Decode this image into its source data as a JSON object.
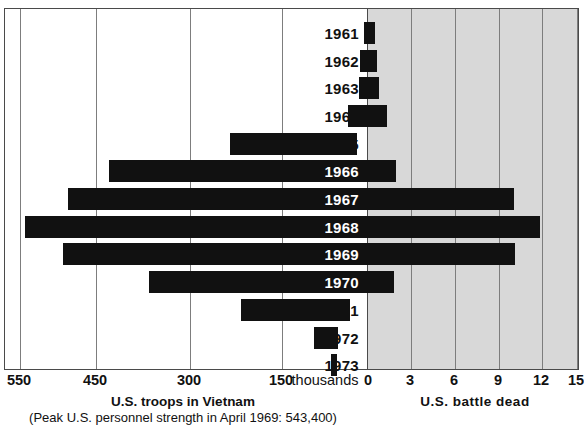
{
  "chart_data": {
    "type": "bar",
    "title": "",
    "subtype": "bidirectional-bar",
    "categories": [
      "1961",
      "1962",
      "1963",
      "1964",
      "1965",
      "1966",
      "1967",
      "1968",
      "1969",
      "1970",
      "1971",
      "1972",
      "1973"
    ],
    "left_axis": {
      "label": "U.S. troops in Vietnam",
      "sublabel": "(Peak U.S. personnel strength in April 1969: 543,400)",
      "unit_label": "thousands",
      "ticks": [
        "550",
        "450",
        "300",
        "150"
      ],
      "tick_values": [
        550,
        450,
        300,
        150
      ],
      "tick_px": [
        19,
        95,
        189,
        281
      ],
      "zero_px": 366,
      "grid": true
    },
    "right_axis": {
      "label": "U.S. battle dead",
      "ticks": [
        "0",
        "3",
        "6",
        "9",
        "12",
        "15"
      ],
      "tick_values": [
        0,
        3,
        6,
        9,
        12,
        15
      ],
      "tick_px": [
        368,
        410,
        454,
        498,
        541,
        576
      ],
      "grid": true,
      "shaded": true,
      "shade_color": "#d8d8d8"
    },
    "series": [
      {
        "name": "U.S. troops in Vietnam",
        "side": "left",
        "values": [
          3.2,
          11.3,
          16.3,
          23.3,
          184.3,
          385.3,
          485.6,
          536.1,
          475.2,
          334.6,
          156.8,
          24.2,
          0.0
        ],
        "px_left": [
          363,
          359,
          358,
          347,
          229,
          108,
          67,
          24,
          62,
          148,
          240,
          313,
          330
        ]
      },
      {
        "name": "U.S. battle dead",
        "side": "right",
        "values": [
          0.1,
          0.3,
          0.5,
          0.6,
          1.4,
          5.0,
          9.4,
          11.6,
          9.4,
          4.2,
          1.4,
          0.3,
          0.2
        ],
        "px_right": [
          374,
          376,
          378,
          386,
          356,
          395,
          513,
          539,
          514,
          393,
          349,
          337,
          336
        ]
      }
    ],
    "bar_color": "#111111",
    "rows_px": [
      {
        "year": "1961",
        "top": 10,
        "height": 27.7,
        "left": 363,
        "right": 374
      },
      {
        "year": "1962",
        "top": 37.7,
        "height": 27.7,
        "left": 359,
        "right": 376
      },
      {
        "year": "1963",
        "top": 65.4,
        "height": 27.7,
        "left": 358,
        "right": 378
      },
      {
        "year": "1964",
        "top": 93.1,
        "height": 27.7,
        "left": 347,
        "right": 386
      },
      {
        "year": "1965",
        "top": 120.8,
        "height": 27.7,
        "left": 229,
        "right": 356
      },
      {
        "year": "1966",
        "top": 148.5,
        "height": 27.7,
        "left": 108,
        "right": 395
      },
      {
        "year": "1967",
        "top": 176.2,
        "height": 27.7,
        "left": 67,
        "right": 513
      },
      {
        "year": "1968",
        "top": 203.9,
        "height": 27.7,
        "left": 24,
        "right": 539
      },
      {
        "year": "1969",
        "top": 231.6,
        "height": 27.7,
        "left": 62,
        "right": 514
      },
      {
        "year": "1970",
        "top": 259.3,
        "height": 27.7,
        "left": 148,
        "right": 393
      },
      {
        "year": "1971",
        "top": 287.0,
        "height": 27.7,
        "left": 240,
        "right": 349
      },
      {
        "year": "1972",
        "top": 314.7,
        "height": 27.7,
        "left": 313,
        "right": 337
      },
      {
        "year": "1973",
        "top": 342.4,
        "height": 27.7,
        "left": 330,
        "right": 336
      }
    ]
  },
  "axis_labels": {
    "l550": "550",
    "l450": "450",
    "l300": "300",
    "l150": "150",
    "thousands": "thousands",
    "r0": "0",
    "r3": "3",
    "r6": "6",
    "r9": "9",
    "r12": "12",
    "r15": "15"
  },
  "captions": {
    "left_title": "U.S. troops in Vietnam",
    "left_note": "(Peak U.S. personnel strength in April 1969: 543,400)",
    "right_title": "U.S.  battle  dead"
  },
  "years": {
    "y1961": "1961",
    "y1962": "1962",
    "y1963": "1963",
    "y1964": "1964",
    "y1965": "1965",
    "y1966": "1966",
    "y1967": "1967",
    "y1968": "1968",
    "y1969": "1969",
    "y1970": "1970",
    "y1971": "1971",
    "y1972": "1972",
    "y1973": "1973"
  }
}
